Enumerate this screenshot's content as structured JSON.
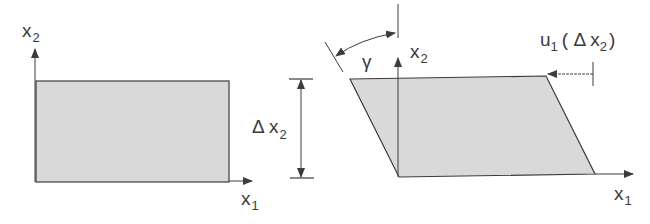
{
  "diagram": {
    "colors": {
      "fill": "#d9d9d9",
      "stroke": "#3c3c3c",
      "background": "#ffffff"
    },
    "left_panel": {
      "title": "undeformed element",
      "x_axis_label": "x",
      "x_axis_sub": "1",
      "y_axis_label": "x",
      "y_axis_sub": "2"
    },
    "dimension": {
      "label_prefix": "Δ x",
      "label_sub": "2"
    },
    "right_panel": {
      "title": "sheared element",
      "x_axis_label": "x",
      "x_axis_sub": "1",
      "y_axis_label": "x",
      "y_axis_sub": "2",
      "angle_label": "γ",
      "displacement_label_main": "u",
      "displacement_label_sub": "1",
      "displacement_label_arg_open": "( Δ x",
      "displacement_label_arg_sub": "2",
      "displacement_label_arg_close": ")"
    }
  }
}
